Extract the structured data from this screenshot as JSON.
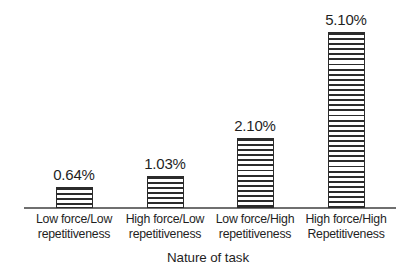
{
  "chart_data": {
    "type": "bar",
    "title": "",
    "subtitle": "",
    "xlabel": "Nature of task",
    "ylabel": "",
    "grid": false,
    "legend": false,
    "ylim": [
      0,
      5.6
    ],
    "axis_line": "baseline only",
    "categories": [
      "Low force/Low repetitiveness",
      "High force/Low repetitiveness",
      "Low force/High repetitiveness",
      "High force/High Repetitiveness"
    ],
    "category_lines": [
      {
        "line1": "Low force/Low",
        "line2": "repetitiveness"
      },
      {
        "line1": "High force/Low",
        "line2": "repetitiveness"
      },
      {
        "line1": "Low force/High",
        "line2": "repetitiveness"
      },
      {
        "line1": "High force/High",
        "line2": "Repetitiveness"
      }
    ],
    "values": [
      0.64,
      1.03,
      2.1,
      5.1
    ],
    "value_labels": [
      "0.64%",
      "1.03%",
      "2.10%",
      "5.10%"
    ],
    "units": "percent",
    "bar_fill": "horizontal-stripe-hatch",
    "colors": {
      "bar_outline": "#2b2b2b",
      "bar_hatch": "#2b2b2b",
      "bar_background": "#ffffff",
      "axis": "#6f6f6f",
      "text": "#1f1f1f",
      "page_background": "#ffffff"
    }
  }
}
